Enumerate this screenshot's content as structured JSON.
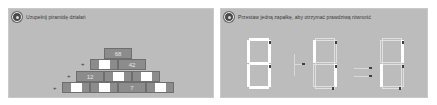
{
  "panels": [
    {
      "id": "pyramid",
      "instruction": "Uzupełnij piramidę działań",
      "icon": "numbered-bullet-icon",
      "operation_symbol": "+",
      "pyramid": {
        "rows": [
          [
            "68"
          ],
          [
            "",
            "42"
          ],
          [
            "12",
            "",
            ""
          ],
          [
            "",
            "",
            "7",
            ""
          ]
        ]
      }
    },
    {
      "id": "matchsticks",
      "instruction": "Przestaw jedną zapałkę, aby otrzymać prawdziwą równość",
      "icon": "numbered-bullet-icon",
      "equation": {
        "digit_1": "8",
        "operator": "+",
        "digit_2": "6",
        "equals": "=",
        "digit_3": "8"
      }
    }
  ],
  "colors": {
    "panel_bg": "#bcbcbc",
    "brick": "#8c8c8c",
    "brick_border": "#6e6e6e",
    "blank_cell": "#ffffff",
    "match": "#ffffff",
    "match_head": "#3f3f3f"
  }
}
